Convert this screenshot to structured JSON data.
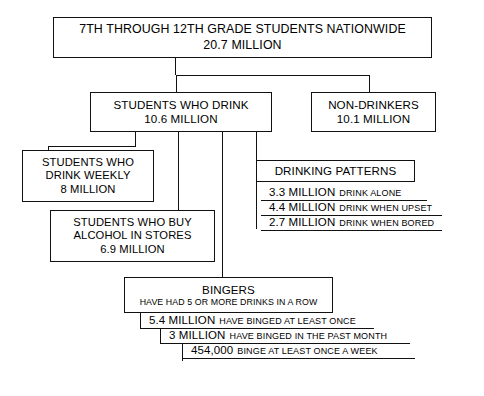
{
  "diagram": {
    "title_node": {
      "line1": "7TH THROUGH 12TH GRADE STUDENTS NATIONWIDE",
      "line2": "20.7 MILLION"
    },
    "drinkers_node": {
      "line1": "STUDENTS WHO DRINK",
      "line2": "10.6 MILLION"
    },
    "nondrinkers_node": {
      "line1": "NON-DRINKERS",
      "line2": "10.1 MILLION"
    },
    "weekly_node": {
      "line1": "STUDENTS WHO",
      "line2": "DRINK WEEKLY",
      "line3": "8 MILLION"
    },
    "stores_node": {
      "line1": "STUDENTS WHO BUY",
      "line2": "ALCOHOL IN STORES",
      "line3": "6.9 MILLION"
    },
    "patterns_node": {
      "title": "DRINKING PATTERNS",
      "rows": [
        {
          "value": "3.3 MILLION",
          "label": "DRINK ALONE"
        },
        {
          "value": "4.4 MILLION",
          "label": "DRINK WHEN UPSET"
        },
        {
          "value": "2.7 MILLION",
          "label": "DRINK WHEN BORED"
        }
      ]
    },
    "bingers_node": {
      "line1": "BINGERS",
      "line2": "HAVE HAD 5 OR MORE DRINKS IN A ROW",
      "rows": [
        {
          "value": "5.4 MILLION",
          "label": "HAVE BINGED AT LEAST ONCE"
        },
        {
          "value": "3 MILLION",
          "label": "HAVE BINGED IN THE PAST MONTH"
        },
        {
          "value": "454,000",
          "label": "BINGE AT LEAST ONCE A WEEK"
        }
      ]
    },
    "colors": {
      "stroke": "#111111",
      "background": "#ffffff",
      "text": "#000000"
    }
  }
}
